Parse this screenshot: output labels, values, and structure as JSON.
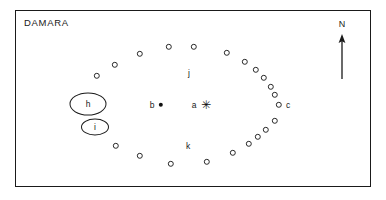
{
  "figure": {
    "title": "DAMARA",
    "type": "archaeological-site-plan",
    "background_color": "#ffffff",
    "frame_color": "#1a1a1a",
    "ink_color": "#1a1a1a"
  },
  "compass": {
    "label": "N",
    "direction": "up",
    "icon": "north-arrow-icon"
  },
  "enclosures": [
    {
      "label": "h",
      "cx": 88,
      "cy": 104,
      "rx": 18.5,
      "ry": 11.5,
      "shape": "ellipse"
    },
    {
      "label": "i",
      "cx": 95,
      "cy": 127,
      "rx": 14,
      "ry": 8.5,
      "shape": "ellipse"
    }
  ],
  "markers": [
    {
      "label": "a",
      "glyph": "asterisk",
      "symbol": "✳",
      "x": 205,
      "y": 105,
      "label_x": 194,
      "label_y": 105
    },
    {
      "label": "b",
      "glyph": "filled-dot",
      "symbol": "●",
      "x": 161,
      "y": 105,
      "label_x": 152,
      "label_y": 105
    }
  ],
  "area_labels": [
    {
      "label": "c",
      "x": 288,
      "y": 105
    },
    {
      "label": "j",
      "x": 189,
      "y": 73
    },
    {
      "label": "k",
      "x": 188,
      "y": 146
    }
  ],
  "ring": {
    "description": "ring of small open circles forming an oval enclosure",
    "symbol": "open-circle",
    "count": 31,
    "points": [
      {
        "x": 169,
        "y": 48
      },
      {
        "x": 193,
        "y": 47
      },
      {
        "x": 226,
        "y": 53
      },
      {
        "x": 140,
        "y": 54
      },
      {
        "x": 115,
        "y": 65
      },
      {
        "x": 97,
        "y": 76
      },
      {
        "x": 245,
        "y": 61
      },
      {
        "x": 256,
        "y": 69
      },
      {
        "x": 263,
        "y": 76
      },
      {
        "x": 270,
        "y": 84
      },
      {
        "x": 274,
        "y": 92
      },
      {
        "x": 279,
        "y": 99
      },
      {
        "x": 277,
        "y": 106
      },
      {
        "x": 275,
        "y": 120
      },
      {
        "x": 266,
        "y": 129
      },
      {
        "x": 260,
        "y": 136
      },
      {
        "x": 251,
        "y": 143
      },
      {
        "x": 238,
        "y": 152
      },
      {
        "x": 218,
        "y": 160
      },
      {
        "x": 188,
        "y": 162
      },
      {
        "x": 168,
        "y": 163
      },
      {
        "x": 140,
        "y": 156
      },
      {
        "x": 117,
        "y": 146
      },
      {
        "x": 97,
        "y": 76
      }
    ]
  }
}
